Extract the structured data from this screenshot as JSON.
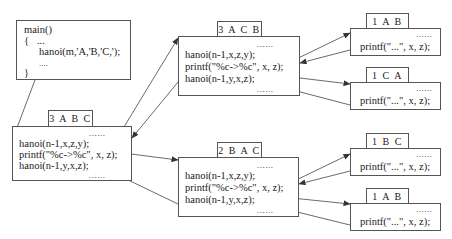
{
  "main_box": {
    "lines": [
      "main()",
      "{   ...",
      "hanoi(m,'A,'B,'C,');",
      "....",
      "}"
    ]
  },
  "frames": [
    {
      "id": "3ABC",
      "label": "3 A B C",
      "dots_top": "......",
      "lines": [
        "hanoi(n-1,x,z,y);",
        "printf(\"%c->%c\", x, z);",
        "hanoi(n-1,y,x,z);"
      ],
      "dots_bottom": "......"
    },
    {
      "id": "3ACB",
      "label": "3 A C B",
      "dots_top": "......",
      "lines": [
        "hanoi(n-1,x,z,y);",
        "printf(\"%c->%c\", x, z);",
        "hanoi(n-1,y,x,z);"
      ],
      "dots_bottom": "......"
    },
    {
      "id": "2BAC",
      "label": "2 B A C",
      "dots_top": "......",
      "lines": [
        "hanoi(n-1,x,z,y);",
        "printf(\"%c->%c\", x, z);",
        "hanoi(n-1,y,x,z);"
      ],
      "dots_bottom": "......"
    },
    {
      "id": "1ABC_top",
      "label": "1 A B C",
      "dots_top": "......",
      "lines": [
        "printf(\"...\", x, z);"
      ]
    },
    {
      "id": "1CAB",
      "label": "1 C A B",
      "dots_top": "......",
      "lines": [
        "printf(\"...\", x, z);"
      ]
    },
    {
      "id": "1BCA",
      "label": "1 B C A",
      "dots_top": "......",
      "lines": [
        "printf(\"...\", x, z);"
      ]
    },
    {
      "id": "1ABC_bottom",
      "label": "1 A B C",
      "dots_top": "......",
      "lines": [
        "printf(\"...\", x, z);"
      ]
    }
  ],
  "colors": {
    "line": "#444444",
    "text": "#1a1a1a",
    "border": "#555555"
  }
}
